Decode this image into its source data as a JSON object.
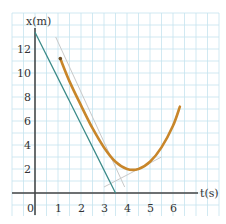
{
  "chart_data": {
    "type": "line",
    "title": "",
    "xlabel": "t(s)",
    "ylabel": "x(m)",
    "xlim": [
      0,
      7
    ],
    "ylim": [
      0,
      14
    ],
    "grid": true,
    "x_ticks": [
      "0",
      "1",
      "2",
      "3",
      "4",
      "5",
      "6"
    ],
    "y_ticks": [
      "2",
      "4",
      "6",
      "8",
      "10",
      "12"
    ],
    "series": [
      {
        "name": "position curve",
        "color": "#c8862a",
        "x": [
          1.1,
          1.5,
          2,
          2.5,
          3,
          3.5,
          4,
          4.5,
          5,
          5.5,
          6,
          6.3
        ],
        "y": [
          11.2,
          9.3,
          7.3,
          5.4,
          3.8,
          2.6,
          2.0,
          2.0,
          2.6,
          3.8,
          5.6,
          7.2
        ]
      },
      {
        "name": "tangent line",
        "color": "#3a8a88",
        "x": [
          0,
          3.5
        ],
        "y": [
          13.4,
          0
        ]
      },
      {
        "name": "secant line (faint)",
        "color": "#c9c9c9",
        "x": [
          0.9,
          3.9
        ],
        "y": [
          13.0,
          0.5
        ]
      },
      {
        "name": "secant line near minimum (faint)",
        "color": "#c9c9c9",
        "x": [
          3.0,
          5.5
        ],
        "y": [
          0.5,
          3.0
        ]
      }
    ]
  },
  "labels": {
    "y_axis": "x(m)",
    "x_axis": "t(s)",
    "origin": "0"
  }
}
